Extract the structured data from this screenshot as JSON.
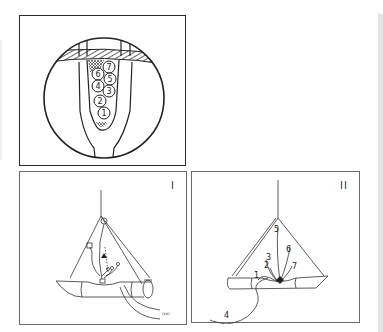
{
  "figure": {
    "top_panel": {
      "description": "Circular magnified cross-section with numbered cells inside a funnel",
      "cell_labels": [
        "1",
        "2",
        "3",
        "4",
        "5",
        "6",
        "7"
      ]
    },
    "panel_i": {
      "label": "I",
      "small_annotation": "(xx)"
    },
    "panel_ii": {
      "label": "II",
      "line_labels": [
        "1",
        "2",
        "3",
        "4",
        "5",
        "6",
        "7"
      ]
    }
  },
  "colors": {
    "line": "#222222",
    "frame_top": "#2a2a2a",
    "frame_bottom": "#6a6a6a",
    "strip": "#e4e4e4"
  }
}
